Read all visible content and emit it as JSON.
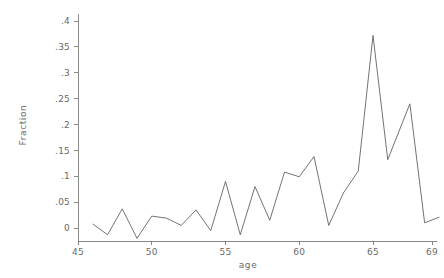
{
  "chart_data": {
    "type": "line",
    "title": "",
    "subtitle": "",
    "xlabel": "age",
    "ylabel": "Fraction",
    "xlim": [
      45,
      69.6
    ],
    "ylim": [
      -0.027,
      0.415
    ],
    "grid": false,
    "legend": null,
    "legend_position": "none",
    "x_ticks": [
      45,
      50,
      55,
      60,
      65,
      69
    ],
    "x_tick_labels": [
      "45",
      "50",
      "55",
      "60",
      "65",
      "69"
    ],
    "y_ticks": [
      0,
      0.05,
      0.1,
      0.15,
      0.2,
      0.25,
      0.3,
      0.35,
      0.4
    ],
    "y_tick_labels": [
      "0",
      ".05",
      ".1",
      ".15",
      ".2",
      ".25",
      ".3",
      ".35",
      ".4"
    ],
    "x": [
      46,
      47,
      48,
      49,
      50,
      51,
      52,
      53,
      54,
      55,
      56,
      57,
      58,
      59,
      60,
      61,
      62,
      63,
      64,
      65,
      66,
      67.5,
      68.5,
      69.5
    ],
    "y": [
      0.008,
      -0.013,
      0.037,
      -0.02,
      0.023,
      0.019,
      0.005,
      0.035,
      -0.005,
      0.09,
      -0.013,
      0.08,
      0.015,
      0.108,
      0.099,
      0.138,
      0.005,
      0.068,
      0.11,
      0.372,
      0.132,
      0.24,
      0.01,
      0.021
    ],
    "series": [
      {
        "name": "Fraction",
        "color": "#5a5a5a",
        "values": [
          0.008,
          -0.013,
          0.037,
          -0.02,
          0.023,
          0.019,
          0.005,
          0.035,
          -0.005,
          0.09,
          -0.013,
          0.08,
          0.015,
          0.108,
          0.099,
          0.138,
          0.005,
          0.068,
          0.11,
          0.372,
          0.132,
          0.24,
          0.01,
          0.021
        ]
      }
    ],
    "annotations": []
  },
  "axis": {
    "x_title": "age",
    "y_title": "Fraction"
  },
  "colors": {
    "background": "#ffffff",
    "axis": "#7d7d7d",
    "text": "#6a6a6a",
    "line": "#5a5a5a"
  }
}
